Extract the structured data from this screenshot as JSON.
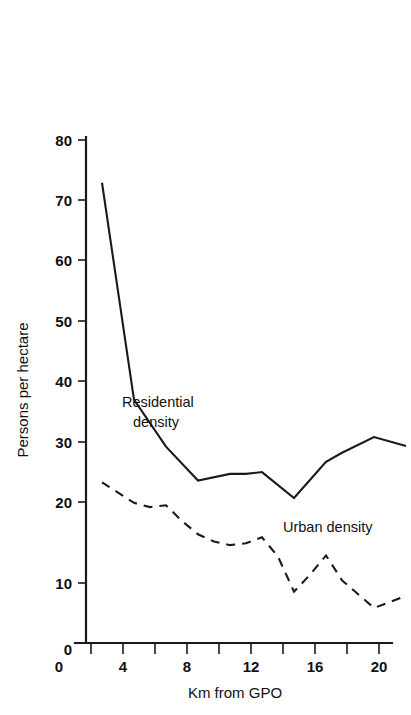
{
  "chart_data": {
    "type": "line",
    "title": "",
    "xlabel": "Km from GPO",
    "ylabel": "Persons per hectare",
    "xlim": [
      0,
      21
    ],
    "ylim": [
      0,
      80
    ],
    "grid": false,
    "legend_position": "inline-annotation",
    "x_ticks": [
      0,
      2,
      4,
      6,
      8,
      10,
      12,
      14,
      16,
      18,
      20
    ],
    "x_tick_labels": [
      "0",
      "",
      "4",
      "",
      "8",
      "",
      "12",
      "",
      "16",
      "",
      "20"
    ],
    "y_ticks": [
      0,
      10,
      20,
      30,
      40,
      50,
      60,
      70,
      80
    ],
    "y_tick_labels": [
      "0",
      "10",
      "20",
      "30",
      "40",
      "50",
      "60",
      "70",
      "80"
    ],
    "series": [
      {
        "name": "Residential density",
        "style": "solid",
        "label_lines": [
          "Residential",
          "density"
        ],
        "x": [
          1,
          3,
          5,
          7,
          9,
          10,
          11,
          13,
          15,
          16,
          18,
          20
        ],
        "values": [
          76.2,
          40.3,
          32.5,
          26.9,
          28.0,
          28.0,
          28.3,
          24.0,
          30.0,
          31.5,
          34.1,
          32.6
        ]
      },
      {
        "name": "Urban density",
        "style": "dashed",
        "label_lines": [
          "Urban density"
        ],
        "x": [
          1,
          3,
          4,
          5,
          6,
          7,
          8,
          9,
          10,
          11,
          12,
          13,
          14,
          15,
          16,
          18,
          20
        ],
        "values": [
          26.6,
          23.2,
          22.5,
          22.8,
          20.2,
          18.0,
          16.8,
          16.2,
          16.5,
          17.5,
          14.3,
          8.5,
          11.3,
          14.5,
          10.4,
          5.8,
          7.8
        ]
      }
    ]
  },
  "labels": {
    "y_axis_title": "Persons per hectare",
    "x_axis_title": "Km from GPO",
    "residential_line_1": "Residential",
    "residential_line_2": "density",
    "urban_label": "Urban density",
    "y_80": "80",
    "y_70": "70",
    "y_60": "60",
    "y_50": "50",
    "y_40": "40",
    "y_30": "30",
    "y_20": "20",
    "y_10": "10",
    "y_0": "0",
    "x_0": "0",
    "x_4": "4",
    "x_8": "8",
    "x_12": "12",
    "x_16": "16",
    "x_20": "20"
  },
  "colors": {
    "ink": "#1a1a1a",
    "background": "#ffffff"
  }
}
